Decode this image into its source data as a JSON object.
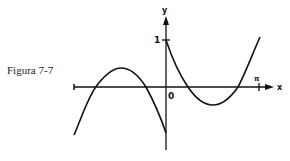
{
  "figure": {
    "caption": "Figura 7-7"
  },
  "axes": {
    "x_label": "x",
    "y_label": "y",
    "origin_label": "0",
    "y_tick_label": "1",
    "x_tick_label": "π"
  },
  "curves": [
    {
      "name": "left-branch",
      "description": "arch above x-axis for x<0, falling to negative value at y-axis"
    },
    {
      "name": "right-branch",
      "description": "starts at y=1, dips below x-axis, rises past x=π"
    }
  ],
  "colors": {
    "ink": "#111111",
    "background": "#ffffff"
  }
}
